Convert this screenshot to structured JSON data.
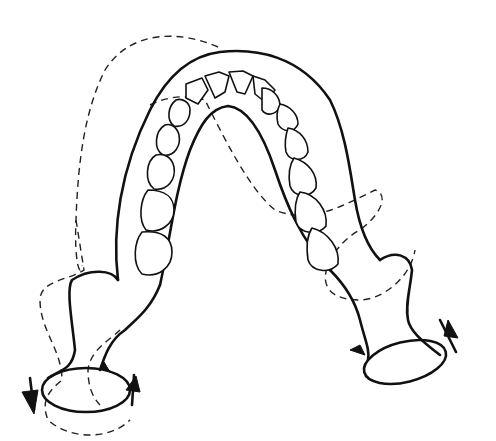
{
  "figure": {
    "colors": {
      "background": "#ffffff",
      "ink": "#111111"
    },
    "elements": [
      "mandible-outline",
      "dental-arch-teeth",
      "dashed-displaced-outline",
      "left-condyle",
      "right-condyle",
      "rotation-arrows"
    ]
  }
}
